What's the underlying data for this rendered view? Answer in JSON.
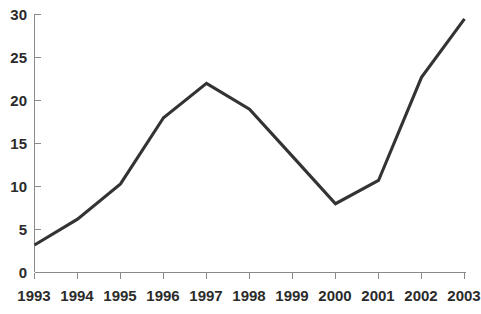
{
  "chart_data": {
    "type": "line",
    "title": "",
    "subtitle": "",
    "xlabel": "",
    "ylabel": "",
    "x": [
      "1993",
      "1994",
      "1995",
      "1996",
      "1997",
      "1998",
      "1999",
      "2000",
      "2001",
      "2002",
      "2003"
    ],
    "categories": [
      "1993",
      "1994",
      "1995",
      "1996",
      "1997",
      "1998",
      "1999",
      "2000",
      "2001",
      "2002",
      "2003"
    ],
    "values": [
      3.2,
      6.2,
      10.3,
      18.0,
      22.0,
      19.0,
      13.5,
      8.0,
      10.7,
      22.7,
      29.5
    ],
    "series": [
      {
        "name": "",
        "values": [
          3.2,
          6.2,
          10.3,
          18.0,
          22.0,
          19.0,
          13.5,
          8.0,
          10.7,
          22.7,
          29.5
        ]
      }
    ],
    "xlim": [
      "1993",
      "2003"
    ],
    "ylim": [
      0,
      30
    ],
    "ytick_labels": [
      "0",
      "5",
      "10",
      "15",
      "20",
      "25",
      "30"
    ],
    "ytick_values": [
      0,
      5,
      10,
      15,
      20,
      25,
      30
    ],
    "xtick_labels": [
      "1993",
      "1994",
      "1995",
      "1996",
      "1997",
      "1998",
      "1999",
      "2000",
      "2001",
      "2002",
      "2003"
    ],
    "grid": false,
    "legend": false,
    "legend_position": "none",
    "annotations": [],
    "colors": {
      "line": "#333333",
      "axis": "#8a8a8a",
      "label_text": "#2b2b2b",
      "background": "#ffffff"
    }
  }
}
